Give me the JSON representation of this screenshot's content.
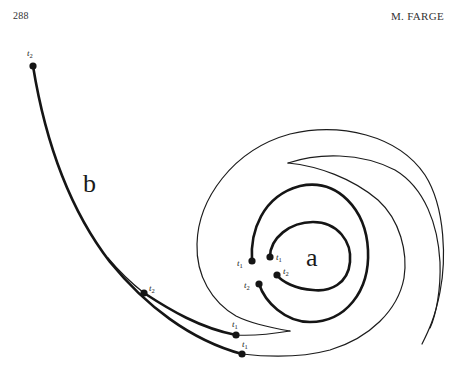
{
  "header": {
    "page_number": "288",
    "author": "M. FARGE"
  },
  "figure": {
    "curve_labels": {
      "a": "a",
      "b": "b"
    },
    "time_markers": {
      "t": "t",
      "sub1": "1",
      "sub2": "2"
    },
    "points": [
      {
        "id": "b-long-start",
        "label": "t2",
        "x": 33,
        "y": 66
      },
      {
        "id": "b-branch-start",
        "label": "t2",
        "x": 144,
        "y": 293
      },
      {
        "id": "b-branch-end",
        "label": "t1",
        "x": 236,
        "y": 335
      },
      {
        "id": "b-long-end",
        "label": "t1",
        "x": 242,
        "y": 354
      },
      {
        "id": "a-outer-start",
        "label": "t1",
        "x": 252,
        "y": 261
      },
      {
        "id": "a-inner-start",
        "label": "t1",
        "x": 270,
        "y": 257
      },
      {
        "id": "a-outer-end",
        "label": "t2",
        "x": 259,
        "y": 284
      },
      {
        "id": "a-inner-end",
        "label": "t2",
        "x": 277,
        "y": 275
      }
    ],
    "colors": {
      "ink": "#151515",
      "background": "#ffffff"
    }
  }
}
